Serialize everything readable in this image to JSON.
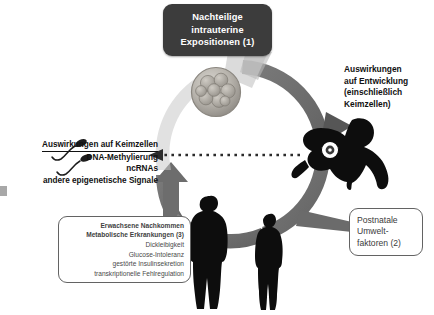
{
  "figure": {
    "background_color": "#ffffff",
    "ring_color": "#6e6e6e",
    "dark_box_color": "#3c3c3c",
    "silhouette_color": "#101010"
  },
  "callouts": {
    "intrauterine": {
      "name": "Nachteilige intrauterine Expositionen",
      "lines": [
        "Nachteilige",
        "intrauterine",
        "Expositionen (1)"
      ]
    },
    "offspring": {
      "name": "Erwachsene Nachkommen",
      "lines": [
        "Erwachsene Nachkommen",
        "Metabolische Erkrankungen (3)",
        "Dickleibigkeit",
        "Glucose-Intoleranz",
        "gestörte Insulinsekretion",
        "transkriptionelle Fehlregulation"
      ],
      "bold_line_count": 2
    },
    "postnatal": {
      "name": "Postnatale Umweltfaktoren",
      "lines": [
        "Postnatale",
        "Umwelt-",
        "faktoren (2)"
      ]
    }
  },
  "labels": {
    "germcells": {
      "name": "Auswirkungen auf Keimzellen",
      "heading": "Auswirkungen auf Keimzellen",
      "lines": [
        "DNA-Methylierung",
        "ncRNAs",
        "andere epigenetische Signale"
      ]
    },
    "development": {
      "name": "Auswirkungen auf Entwicklung",
      "lines": [
        "Auswirkungen",
        "auf Entwicklung",
        "(einschließlich",
        "Keimzellen)"
      ]
    }
  },
  "graphics": {
    "embryo": "morula-embryo",
    "baby": "crawling-baby-silhouette",
    "adult_obese": "obese-adult-silhouette",
    "adult_lean": "lean-adult-silhouette",
    "sperm": "sperm-germ-cells",
    "cycle_arrow": "clockwise-cycle-arrow",
    "feedback_arrow": "dotted-leftward-arrow"
  }
}
